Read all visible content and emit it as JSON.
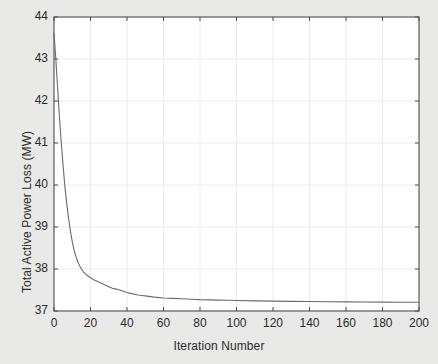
{
  "figure": {
    "background_color": "#e9e9e7",
    "plot_background_color": "#ffffff",
    "axis_color": "#4d4d4d",
    "grid_color": "#ececec",
    "line_color": "#6b6b6b",
    "text_color": "#2b2b2b"
  },
  "chart_data": {
    "type": "line",
    "title": "",
    "xlabel": "Iteration Number",
    "ylabel": "Total Active Power Loss (MW)",
    "xlim": [
      0,
      200
    ],
    "ylim": [
      37,
      44
    ],
    "xticks": [
      0,
      20,
      40,
      60,
      80,
      100,
      120,
      140,
      160,
      180,
      200
    ],
    "yticks": [
      37,
      38,
      39,
      40,
      41,
      42,
      43,
      44
    ],
    "xtick_labels": [
      "0",
      "20",
      "40",
      "60",
      "80",
      "100",
      "120",
      "140",
      "160",
      "180",
      "200"
    ],
    "ytick_labels": [
      "37",
      "38",
      "39",
      "40",
      "41",
      "42",
      "43",
      "44"
    ],
    "grid": true,
    "legend": null,
    "series": [
      {
        "name": "Total Active Power Loss",
        "x": [
          0,
          1,
          2,
          3,
          4,
          5,
          6,
          7,
          8,
          9,
          10,
          11,
          12,
          13,
          14,
          15,
          16,
          17,
          18,
          19,
          20,
          22,
          24,
          26,
          28,
          30,
          32,
          34,
          36,
          38,
          40,
          42,
          44,
          46,
          48,
          50,
          55,
          60,
          65,
          70,
          75,
          80,
          85,
          90,
          95,
          100,
          110,
          120,
          130,
          140,
          150,
          160,
          170,
          180,
          190,
          200
        ],
        "y": [
          43.62,
          43.0,
          42.3,
          41.6,
          41.0,
          40.45,
          39.95,
          39.55,
          39.2,
          38.9,
          38.65,
          38.45,
          38.3,
          38.18,
          38.08,
          38.0,
          37.94,
          37.89,
          37.85,
          37.82,
          37.79,
          37.74,
          37.7,
          37.66,
          37.62,
          37.58,
          37.54,
          37.52,
          37.5,
          37.47,
          37.44,
          37.42,
          37.4,
          37.38,
          37.37,
          37.36,
          37.33,
          37.31,
          37.3,
          37.29,
          37.28,
          37.27,
          37.265,
          37.26,
          37.255,
          37.25,
          37.24,
          37.235,
          37.23,
          37.225,
          37.22,
          37.218,
          37.215,
          37.212,
          37.21,
          37.21
        ]
      }
    ]
  }
}
